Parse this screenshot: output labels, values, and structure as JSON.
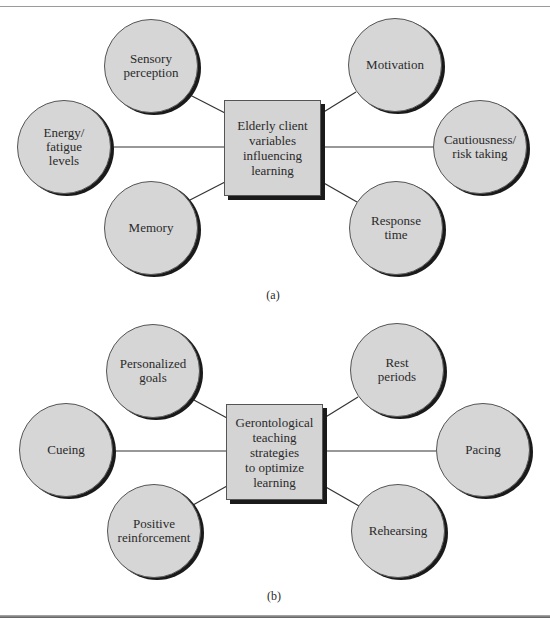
{
  "diagram_a": {
    "center": "Elderly client\nvariables\ninfluencing\nlearning",
    "nodes": {
      "top_left": "Sensory\nperception",
      "top_right": "Motivation",
      "mid_left": "Energy/\nfatigue\nlevels",
      "mid_right": "Cautiousness/\nrisk taking",
      "bottom_left": "Memory",
      "bottom_right": "Response\ntime"
    },
    "caption": "(a)"
  },
  "diagram_b": {
    "center": "Gerontological\nteaching\nstrategies\nto optimize\nlearning",
    "nodes": {
      "top_left": "Personalized\ngoals",
      "top_right": "Rest\nperiods",
      "mid_left": "Cueing",
      "mid_right": "Pacing",
      "bottom_left": "Positive\nreinforcement",
      "bottom_right": "Rehearsing"
    },
    "caption": "(b)"
  },
  "colors": {
    "node_fill": "#d6d6d6",
    "shadow": "#1a1a1a",
    "line": "#333333"
  }
}
